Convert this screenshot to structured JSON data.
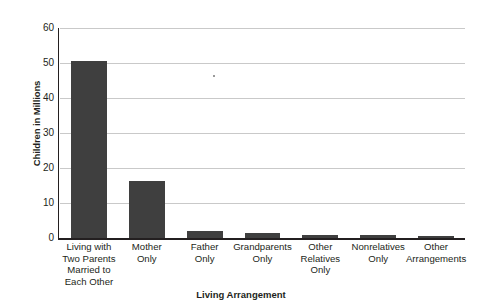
{
  "chart_data": {
    "type": "bar",
    "title": "",
    "xlabel": "Living Arrangement",
    "ylabel": "Children in Millions",
    "categories": [
      "Living with Two Parents Married to Each Other",
      "Mother Only",
      "Father Only",
      "Grandparents Only",
      "Other Relatives Only",
      "Nonrelatives Only",
      "Other Arrangements"
    ],
    "values": [
      50.7,
      16.2,
      2.0,
      1.3,
      0.9,
      0.9,
      0.2
    ],
    "ylim": [
      0,
      60
    ],
    "yticks": [
      0,
      10,
      20,
      30,
      40,
      50,
      60
    ],
    "ytick_labels": [
      "0",
      "10",
      "20",
      "30",
      "40",
      "50",
      "60"
    ],
    "grid": true,
    "legend": false,
    "bar_color": "#3f3f3f",
    "gridline_color": "#c9c9c9",
    "axis_color": "#231f20"
  },
  "x_axis": {
    "title": "Living Arrangement",
    "tick_lines": [
      [
        "Living with",
        "Two Parents",
        "Married to",
        "Each Other"
      ],
      [
        "Mother",
        "Only"
      ],
      [
        "Father",
        "Only"
      ],
      [
        "Grandparents",
        "Only"
      ],
      [
        "Other",
        "Relatives",
        "Only"
      ],
      [
        "Nonrelatives",
        "Only"
      ],
      [
        "Other",
        "Arrangements"
      ]
    ]
  },
  "y_axis": {
    "title": "Children in Millions"
  }
}
